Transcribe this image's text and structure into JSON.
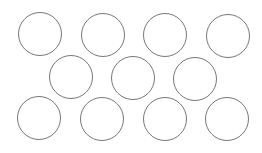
{
  "diagram": {
    "background": "#ffffff",
    "stroke_color": "#777777",
    "stroke_width": 1.3,
    "diameter": 44,
    "rows": [
      {
        "name": "top-row",
        "circles": [
          {
            "cx": 39.5,
            "cy": 34
          },
          {
            "cx": 103,
            "cy": 35
          },
          {
            "cx": 165,
            "cy": 35
          },
          {
            "cx": 227.5,
            "cy": 35.5
          }
        ]
      },
      {
        "name": "middle-row",
        "circles": [
          {
            "cx": 71,
            "cy": 77
          },
          {
            "cx": 133,
            "cy": 78
          },
          {
            "cx": 195,
            "cy": 79
          }
        ]
      },
      {
        "name": "bottom-row",
        "circles": [
          {
            "cx": 39,
            "cy": 118
          },
          {
            "cx": 102,
            "cy": 119
          },
          {
            "cx": 164.5,
            "cy": 119
          },
          {
            "cx": 226.5,
            "cy": 119
          }
        ]
      }
    ]
  }
}
